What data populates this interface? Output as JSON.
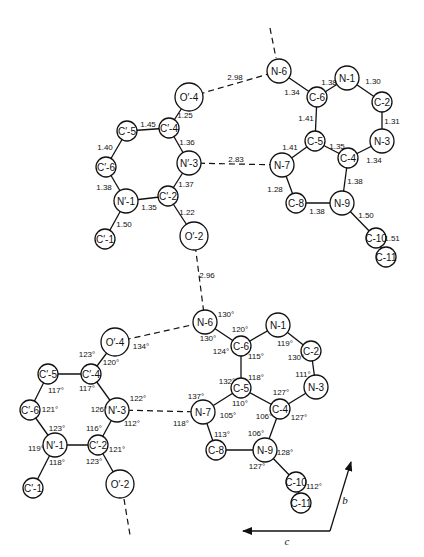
{
  "panels": [
    {
      "id": "bond-lengths",
      "atoms": [
        {
          "id": "a_N6",
          "label": "N-6",
          "x": 279,
          "y": 71,
          "r": 12
        },
        {
          "id": "a_C6",
          "label": "C-6",
          "x": 317,
          "y": 97,
          "r": 10
        },
        {
          "id": "a_N1",
          "label": "N-1",
          "x": 347,
          "y": 78,
          "r": 12
        },
        {
          "id": "a_C2",
          "label": "C-2",
          "x": 382,
          "y": 102,
          "r": 10
        },
        {
          "id": "a_N3",
          "label": "N-3",
          "x": 382,
          "y": 141,
          "r": 12
        },
        {
          "id": "a_C4",
          "label": "C-4",
          "x": 348,
          "y": 158,
          "r": 10
        },
        {
          "id": "a_C5",
          "label": "C-5",
          "x": 315,
          "y": 141,
          "r": 10
        },
        {
          "id": "a_N7",
          "label": "N-7",
          "x": 282,
          "y": 165,
          "r": 12
        },
        {
          "id": "a_C8",
          "label": "C-8",
          "x": 296,
          "y": 203,
          "r": 10
        },
        {
          "id": "a_N9",
          "label": "N-9",
          "x": 342,
          "y": 203,
          "r": 12
        },
        {
          "id": "a_C10",
          "label": "C-10",
          "x": 376,
          "y": 238,
          "r": 10
        },
        {
          "id": "a_C11",
          "label": "C-11",
          "x": 386,
          "y": 257,
          "r": 10
        },
        {
          "id": "u_O4",
          "label": "O′-4",
          "x": 189,
          "y": 97,
          "r": 14
        },
        {
          "id": "u_C4",
          "label": "C′-4",
          "x": 169,
          "y": 128,
          "r": 10
        },
        {
          "id": "u_C5",
          "label": "C′-5",
          "x": 127,
          "y": 131,
          "r": 10
        },
        {
          "id": "u_C6",
          "label": "C′-6",
          "x": 106,
          "y": 167,
          "r": 10
        },
        {
          "id": "u_N1",
          "label": "N′-1",
          "x": 126,
          "y": 201,
          "r": 12
        },
        {
          "id": "u_C2",
          "label": "C′-2",
          "x": 168,
          "y": 196,
          "r": 10
        },
        {
          "id": "u_N3",
          "label": "N′-3",
          "x": 189,
          "y": 163,
          "r": 12
        },
        {
          "id": "u_O2",
          "label": "O′-2",
          "x": 194,
          "y": 236,
          "r": 14
        },
        {
          "id": "u_C1",
          "label": "C′-1",
          "x": 105,
          "y": 239,
          "r": 10
        }
      ],
      "bonds": [
        {
          "from": "a_N6",
          "to": "a_C6",
          "length": "1.34",
          "lx": 292,
          "ly": 92
        },
        {
          "from": "a_C6",
          "to": "a_N1",
          "length": "1.38",
          "lx": 329,
          "ly": 82
        },
        {
          "from": "a_N1",
          "to": "a_C2",
          "length": "1.30",
          "lx": 373,
          "ly": 81
        },
        {
          "from": "a_C2",
          "to": "a_N3",
          "length": "1.31",
          "lx": 392,
          "ly": 121
        },
        {
          "from": "a_N3",
          "to": "a_C4",
          "length": "1.34",
          "lx": 374,
          "ly": 160
        },
        {
          "from": "a_C4",
          "to": "a_C5",
          "length": "1.35",
          "lx": 337,
          "ly": 146
        },
        {
          "from": "a_C5",
          "to": "a_C6",
          "length": "1.41",
          "lx": 306,
          "ly": 118
        },
        {
          "from": "a_C5",
          "to": "a_N7",
          "length": "1.41",
          "lx": 290,
          "ly": 147
        },
        {
          "from": "a_N7",
          "to": "a_C8",
          "length": "1.28",
          "lx": 275,
          "ly": 189
        },
        {
          "from": "a_C8",
          "to": "a_N9",
          "length": "1.38",
          "lx": 317,
          "ly": 211
        },
        {
          "from": "a_N9",
          "to": "a_C4",
          "length": "1.38",
          "lx": 355,
          "ly": 181
        },
        {
          "from": "a_N9",
          "to": "a_C10",
          "length": "1.50",
          "lx": 366,
          "ly": 215
        },
        {
          "from": "a_C10",
          "to": "a_C11",
          "length": "1.51",
          "lx": 392,
          "ly": 238
        },
        {
          "from": "u_O4",
          "to": "u_C4",
          "length": "1.25",
          "lx": 185,
          "ly": 115
        },
        {
          "from": "u_C4",
          "to": "u_C5",
          "length": "1.45",
          "lx": 148,
          "ly": 124
        },
        {
          "from": "u_C5",
          "to": "u_C6",
          "length": "1.40",
          "lx": 105,
          "ly": 147
        },
        {
          "from": "u_C6",
          "to": "u_N1",
          "length": "1.38",
          "lx": 104,
          "ly": 187
        },
        {
          "from": "u_N1",
          "to": "u_C2",
          "length": "1.35",
          "lx": 149,
          "ly": 207
        },
        {
          "from": "u_C2",
          "to": "u_N3",
          "length": "1.37",
          "lx": 186,
          "ly": 184
        },
        {
          "from": "u_N3",
          "to": "u_C4",
          "length": "1.36",
          "lx": 187,
          "ly": 142
        },
        {
          "from": "u_C2",
          "to": "u_O2",
          "length": "1.22",
          "lx": 187,
          "ly": 212
        },
        {
          "from": "u_N1",
          "to": "u_C1",
          "length": "1.50",
          "lx": 124,
          "ly": 224
        }
      ],
      "hbonds": [
        {
          "from": "u_O4",
          "to": "a_N6",
          "distance": "2.98",
          "lx": 235,
          "ly": 77
        },
        {
          "from": "u_N3",
          "to": "a_N7",
          "distance": "2.83",
          "lx": 236,
          "ly": 159
        },
        {
          "from": "u_O2",
          "to": "b_N6",
          "distance": "2.96",
          "lx": 207,
          "ly": 275
        },
        {
          "stub": true,
          "x1": 270,
          "y1": 28,
          "x2": 276,
          "y2": 58
        }
      ]
    },
    {
      "id": "bond-angles",
      "atoms": [
        {
          "id": "b_N6",
          "label": "N-6",
          "x": 205,
          "y": 322,
          "r": 12
        },
        {
          "id": "b_C6",
          "label": "C-6",
          "x": 241,
          "y": 346,
          "r": 10
        },
        {
          "id": "b_N1",
          "label": "N-1",
          "x": 278,
          "y": 325,
          "r": 12
        },
        {
          "id": "b_C2",
          "label": "C-2",
          "x": 311,
          "y": 351,
          "r": 10
        },
        {
          "id": "b_N3",
          "label": "N-3",
          "x": 316,
          "y": 387,
          "r": 12
        },
        {
          "id": "b_C4",
          "label": "C-4",
          "x": 280,
          "y": 409,
          "r": 10
        },
        {
          "id": "b_C5",
          "label": "C-5",
          "x": 241,
          "y": 388,
          "r": 10
        },
        {
          "id": "b_N7",
          "label": "N-7",
          "x": 203,
          "y": 412,
          "r": 12
        },
        {
          "id": "b_C8",
          "label": "C-8",
          "x": 216,
          "y": 450,
          "r": 10
        },
        {
          "id": "b_N9",
          "label": "N-9",
          "x": 265,
          "y": 450,
          "r": 12
        },
        {
          "id": "b_C10",
          "label": "C-10",
          "x": 296,
          "y": 482,
          "r": 10
        },
        {
          "id": "b_C11",
          "label": "C-11",
          "x": 301,
          "y": 503,
          "r": 10
        },
        {
          "id": "v_O4",
          "label": "O′-4",
          "x": 115,
          "y": 342,
          "r": 14
        },
        {
          "id": "v_C4",
          "label": "C′-4",
          "x": 91,
          "y": 374,
          "r": 10
        },
        {
          "id": "v_C5",
          "label": "C′-5",
          "x": 48,
          "y": 374,
          "r": 10
        },
        {
          "id": "v_C6",
          "label": "C′-6",
          "x": 30,
          "y": 410,
          "r": 10
        },
        {
          "id": "v_N1",
          "label": "N′-1",
          "x": 55,
          "y": 445,
          "r": 12
        },
        {
          "id": "v_C2",
          "label": "C′-2",
          "x": 98,
          "y": 445,
          "r": 10
        },
        {
          "id": "v_N3",
          "label": "N′-3",
          "x": 117,
          "y": 410,
          "r": 12
        },
        {
          "id": "v_O2",
          "label": "O′-2",
          "x": 120,
          "y": 484,
          "r": 14
        },
        {
          "id": "v_C1",
          "label": "C′-1",
          "x": 33,
          "y": 488,
          "r": 10
        }
      ],
      "bonds": [
        {
          "from": "b_N6",
          "to": "b_C6"
        },
        {
          "from": "b_C6",
          "to": "b_N1"
        },
        {
          "from": "b_N1",
          "to": "b_C2"
        },
        {
          "from": "b_C2",
          "to": "b_N3"
        },
        {
          "from": "b_N3",
          "to": "b_C4"
        },
        {
          "from": "b_C4",
          "to": "b_C5"
        },
        {
          "from": "b_C5",
          "to": "b_C6"
        },
        {
          "from": "b_C5",
          "to": "b_N7"
        },
        {
          "from": "b_N7",
          "to": "b_C8"
        },
        {
          "from": "b_C8",
          "to": "b_N9"
        },
        {
          "from": "b_N9",
          "to": "b_C4"
        },
        {
          "from": "b_N9",
          "to": "b_C10"
        },
        {
          "from": "b_C10",
          "to": "b_C11"
        },
        {
          "from": "v_O4",
          "to": "v_C4"
        },
        {
          "from": "v_C4",
          "to": "v_C5"
        },
        {
          "from": "v_C5",
          "to": "v_C6"
        },
        {
          "from": "v_C6",
          "to": "v_N1"
        },
        {
          "from": "v_N1",
          "to": "v_C2"
        },
        {
          "from": "v_C2",
          "to": "v_N3"
        },
        {
          "from": "v_N3",
          "to": "v_C4"
        },
        {
          "from": "v_C2",
          "to": "v_O2"
        },
        {
          "from": "v_N1",
          "to": "v_C1"
        }
      ],
      "hbonds": [
        {
          "from": "v_O4",
          "to": "b_N6"
        },
        {
          "from": "v_N3",
          "to": "b_N7"
        },
        {
          "stub": true,
          "x1": 124,
          "y1": 499,
          "x2": 130,
          "y2": 535
        }
      ],
      "angles": [
        {
          "text": "130°",
          "x": 226,
          "y": 314
        },
        {
          "text": "130°",
          "x": 208,
          "y": 338
        },
        {
          "text": "120°",
          "x": 240,
          "y": 329
        },
        {
          "text": "124°",
          "x": 221,
          "y": 351
        },
        {
          "text": "115°",
          "x": 256,
          "y": 356
        },
        {
          "text": "119°",
          "x": 285,
          "y": 343
        },
        {
          "text": "130°",
          "x": 296,
          "y": 357
        },
        {
          "text": "111°",
          "x": 303,
          "y": 374
        },
        {
          "text": "118°",
          "x": 256,
          "y": 377
        },
        {
          "text": "132°",
          "x": 227,
          "y": 381
        },
        {
          "text": "110°",
          "x": 240,
          "y": 403
        },
        {
          "text": "127°",
          "x": 281,
          "y": 392
        },
        {
          "text": "106°",
          "x": 264,
          "y": 416
        },
        {
          "text": "127°",
          "x": 299,
          "y": 417
        },
        {
          "text": "137°",
          "x": 196,
          "y": 396
        },
        {
          "text": "105°",
          "x": 228,
          "y": 415
        },
        {
          "text": "118°",
          "x": 181,
          "y": 423
        },
        {
          "text": "113°",
          "x": 222,
          "y": 434
        },
        {
          "text": "106°",
          "x": 256,
          "y": 433
        },
        {
          "text": "128°",
          "x": 285,
          "y": 452
        },
        {
          "text": "127°",
          "x": 257,
          "y": 466
        },
        {
          "text": "112°",
          "x": 314,
          "y": 486
        },
        {
          "text": "134°",
          "x": 141,
          "y": 346
        },
        {
          "text": "123°",
          "x": 87,
          "y": 354
        },
        {
          "text": "120°",
          "x": 111,
          "y": 362
        },
        {
          "text": "117°",
          "x": 56,
          "y": 390
        },
        {
          "text": "117°",
          "x": 87,
          "y": 388
        },
        {
          "text": "122°",
          "x": 138,
          "y": 398
        },
        {
          "text": "126°",
          "x": 99,
          "y": 409
        },
        {
          "text": "112°",
          "x": 132,
          "y": 423
        },
        {
          "text": "121°",
          "x": 50,
          "y": 409
        },
        {
          "text": "123°",
          "x": 57,
          "y": 428
        },
        {
          "text": "116°",
          "x": 94,
          "y": 428
        },
        {
          "text": "119°",
          "x": 36,
          "y": 448
        },
        {
          "text": "118°",
          "x": 57,
          "y": 462
        },
        {
          "text": "121°",
          "x": 117,
          "y": 449
        },
        {
          "text": "123°",
          "x": 94,
          "y": 461
        }
      ]
    }
  ],
  "axes": {
    "origin": {
      "x": 330,
      "y": 531
    },
    "b": {
      "label": "b",
      "x2": 351,
      "y2": 462,
      "lx": 345,
      "ly": 500
    },
    "c": {
      "label": "c",
      "x2": 243,
      "y2": 531,
      "lx": 287,
      "ly": 541
    }
  }
}
